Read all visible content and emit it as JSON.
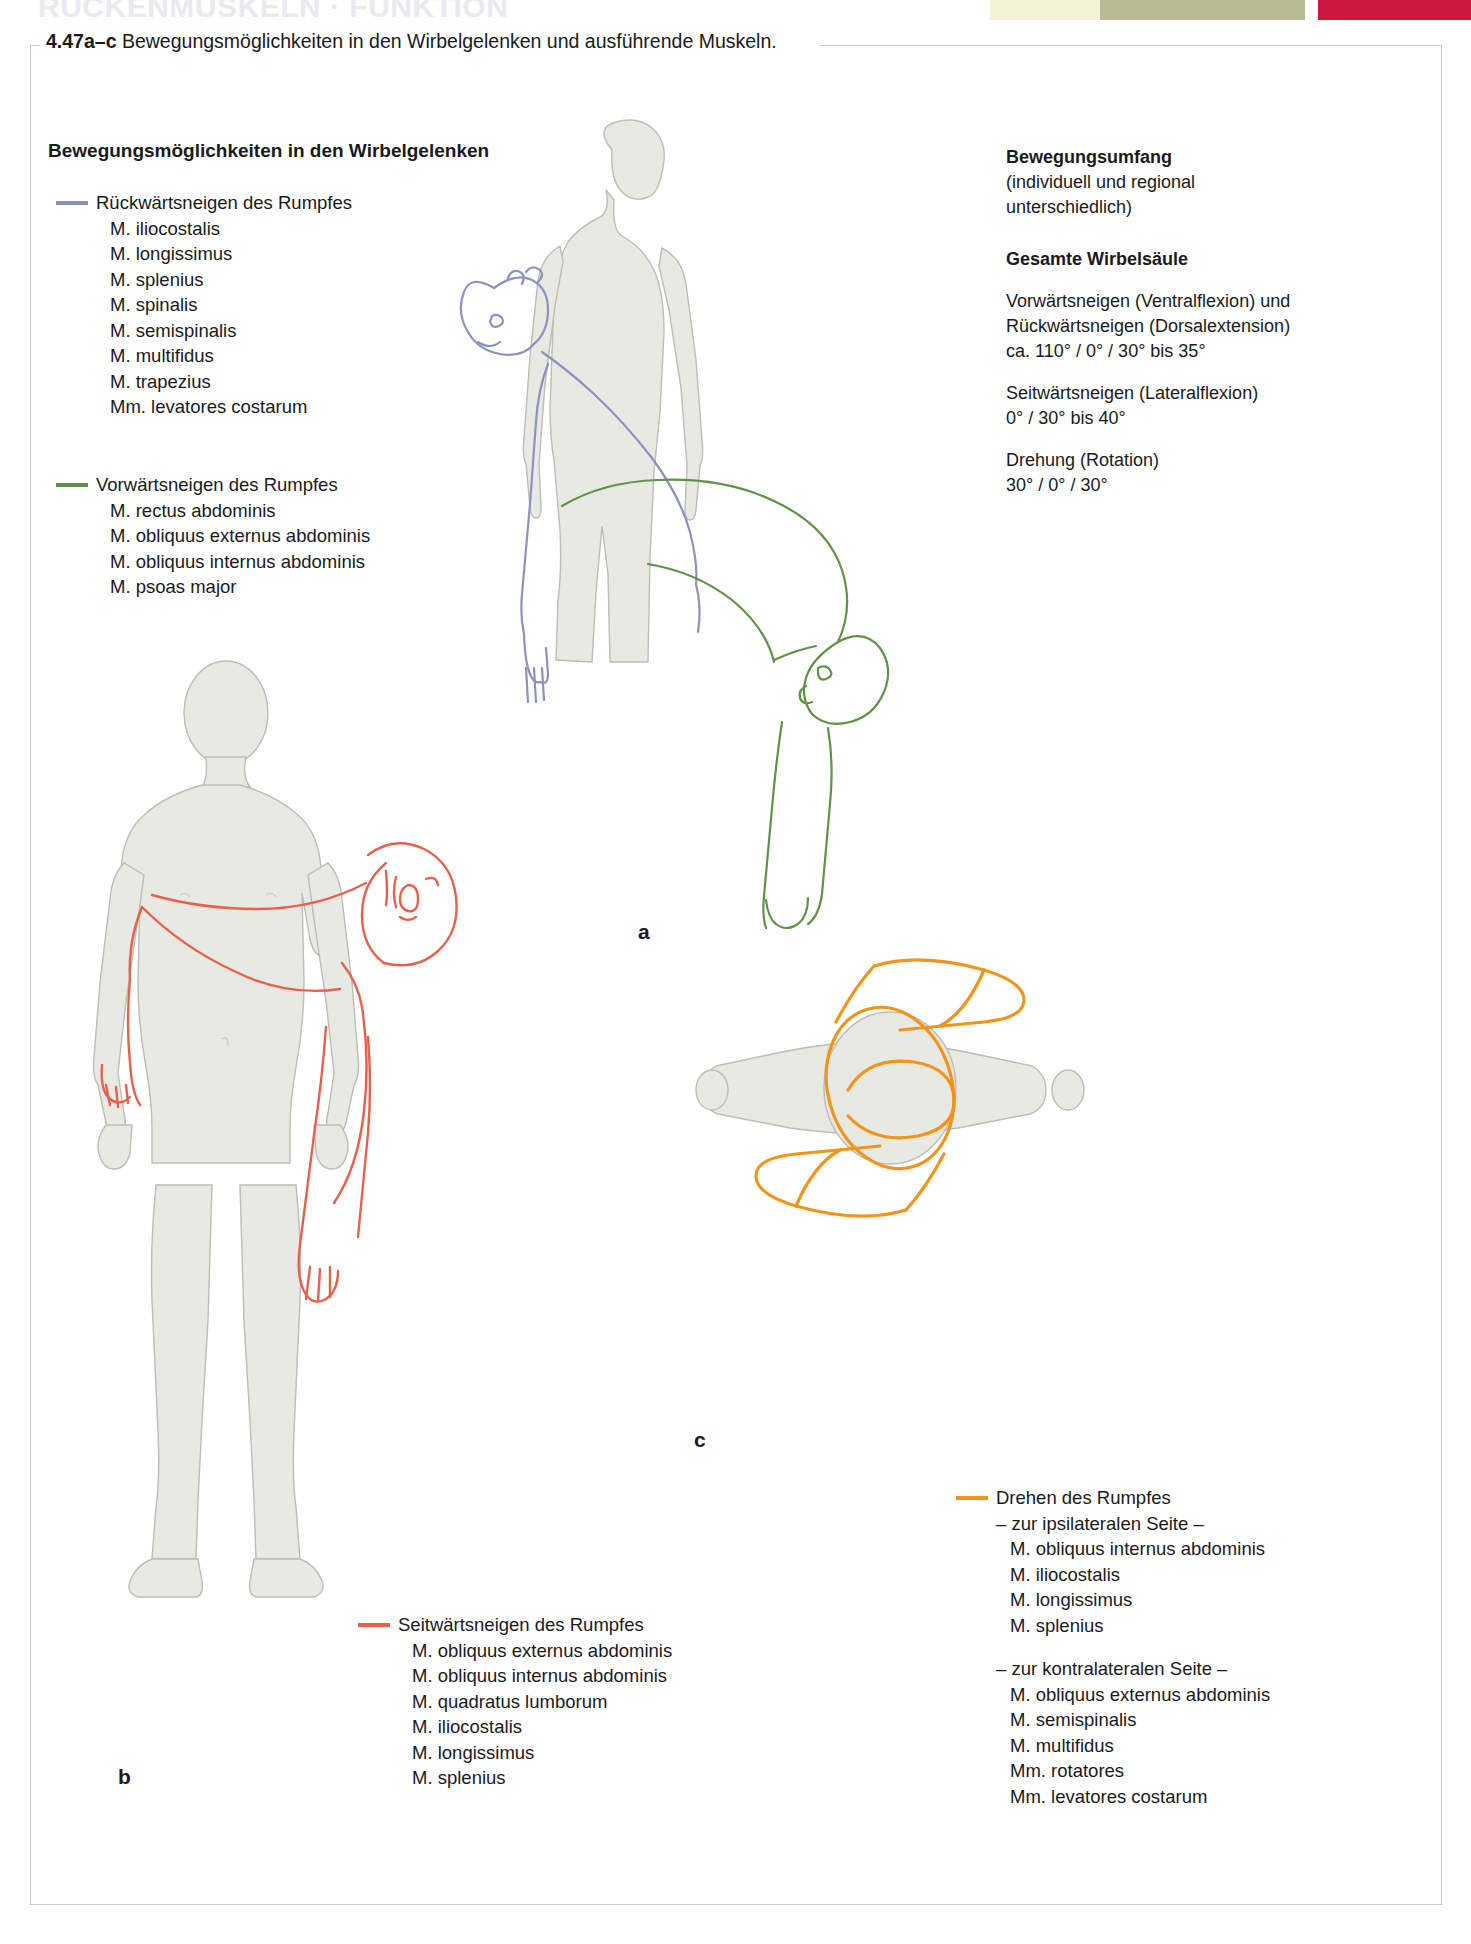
{
  "running_head": "RUCKENMUSKELN · FUNKTION",
  "colors": {
    "extension_blue": "#8a93c0",
    "flexion_green": "#5e9245",
    "lateral_red": "#e8604c",
    "rotation_orange": "#f39318",
    "body_fill": "#e9e9e4",
    "body_stroke": "#b9b9b2",
    "strip_cream": "#f4f2d4",
    "strip_olive": "#b9bb94",
    "strip_red": "#cf1744"
  },
  "caption": {
    "number": "4.47a–c",
    "text": "Bewegungsmöglichkeiten in den Wirbelgelenken und ausführende Muskeln."
  },
  "legend_title": "Bewegungsmöglichkeiten in den Wirbelgelenken",
  "legends": {
    "extension": {
      "head": "Rückwärtsneigen des Rumpfes",
      "color": "#8a93c0",
      "muscles": [
        "M. iliocostalis",
        "M. longissimus",
        "M. splenius",
        "M. spinalis",
        "M. semispinalis",
        "M. multifidus",
        "M. trapezius",
        "Mm. levatores costarum"
      ]
    },
    "flexion": {
      "head": "Vorwärtsneigen des Rumpfes",
      "color": "#5e9245",
      "muscles": [
        "M. rectus abdominis",
        "M. obliquus externus abdominis",
        "M. obliquus internus abdominis",
        "M. psoas major"
      ]
    },
    "lateral": {
      "head": "Seitwärtsneigen des Rumpfes",
      "color": "#e8604c",
      "muscles": [
        "M. obliquus externus abdominis",
        "M. obliquus internus abdominis",
        "M. quadratus lumborum",
        "M. iliocostalis",
        "M. longissimus",
        "M. splenius"
      ]
    },
    "rotation": {
      "head": "Drehen des Rumpfes",
      "color": "#f39318",
      "ipsilateral_label": "– zur ipsilateralen Seite –",
      "ipsilateral": [
        "M. obliquus internus abdominis",
        "M. iliocostalis",
        "M. longissimus",
        "M. splenius"
      ],
      "contralateral_label": "– zur kontralateralen Seite –",
      "contralateral": [
        "M. obliquus externus abdominis",
        "M. semispinalis",
        "M. multifidus",
        "Mm. rotatores",
        "Mm. levatores costarum"
      ]
    }
  },
  "info_panel": {
    "title": "Bewegungsumfang",
    "subtitle": "(individuell und regional unterschiedlich)",
    "section": "Gesamte Wirbelsäule",
    "items": [
      {
        "label_line1": "Vorwärtsneigen (Ventralflexion) und",
        "label_line2": "Rückwärtsneigen (Dorsalextension)",
        "value": "ca. 110° / 0° / 30° bis 35°"
      },
      {
        "label_line1": "Seitwärtsneigen (Lateralflexion)",
        "label_line2": "",
        "value": " 0° / 30° bis 40°"
      },
      {
        "label_line1": "Drehung (Rotation)",
        "label_line2": "",
        "value": "30° / 0° / 30°"
      }
    ]
  },
  "panel_letters": {
    "a": "a",
    "b": "b",
    "c": "c"
  }
}
